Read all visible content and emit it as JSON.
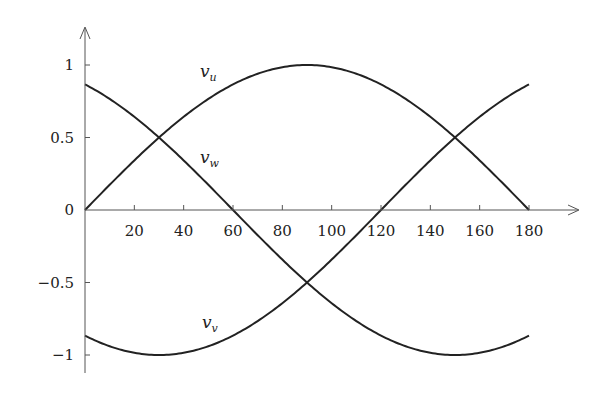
{
  "chart_data": {
    "type": "line",
    "title": "",
    "xlabel": "",
    "ylabel": "",
    "xlim": [
      0,
      180
    ],
    "ylim": [
      -1.15,
      1.2
    ],
    "grid": false,
    "legend": "inline labels",
    "x_ticks": [
      20,
      40,
      60,
      80,
      100,
      120,
      140,
      160,
      180
    ],
    "x_tick_labels": [
      "20",
      "40",
      "60",
      "80",
      "100",
      "120",
      "140",
      "160",
      "180"
    ],
    "y_ticks": [
      1,
      0.5,
      0,
      -0.5,
      -1
    ],
    "y_tick_labels": [
      "1",
      "0.5",
      "0",
      "−0.5",
      "−1"
    ],
    "x": [
      0,
      15,
      30,
      45,
      60,
      75,
      90,
      105,
      120,
      135,
      150,
      165,
      180
    ],
    "series": [
      {
        "name": "v_u",
        "label_main": "v",
        "label_sub": "u",
        "formula": "sin(x)",
        "values": [
          0,
          0.259,
          0.5,
          0.707,
          0.866,
          0.966,
          1,
          0.966,
          0.866,
          0.707,
          0.5,
          0.259,
          0
        ]
      },
      {
        "name": "v_w",
        "label_main": "v",
        "label_sub": "w",
        "formula": "sin(x+120)",
        "values": [
          0.866,
          0.707,
          0.5,
          0.259,
          0,
          -0.259,
          -0.5,
          -0.707,
          -0.866,
          -0.966,
          -1,
          -0.966,
          -0.866
        ]
      },
      {
        "name": "v_v",
        "label_main": "v",
        "label_sub": "v",
        "formula": "sin(x-120)",
        "values": [
          -0.866,
          -0.966,
          -1,
          -0.966,
          -0.866,
          -0.707,
          -0.5,
          -0.259,
          0,
          0.259,
          0.5,
          0.707,
          0.866
        ]
      }
    ],
    "colors": {
      "curve": "#222222",
      "axis": "#555555"
    }
  }
}
